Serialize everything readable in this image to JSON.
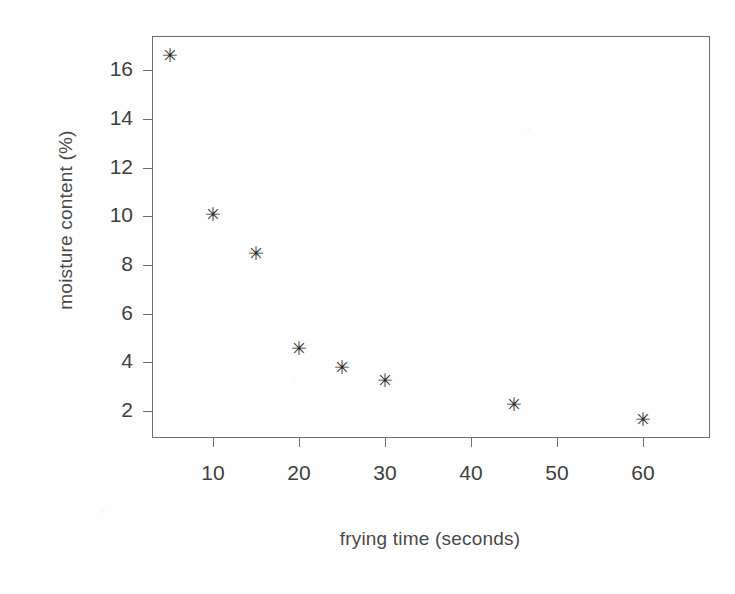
{
  "chart_data": {
    "type": "scatter",
    "title": "",
    "xlabel": "frying time (seconds)",
    "ylabel": "moisture content (%)",
    "x": [
      5,
      10,
      15,
      20,
      25,
      30,
      45,
      60
    ],
    "values": [
      16.6,
      10.1,
      8.5,
      4.6,
      3.8,
      3.3,
      2.3,
      1.7
    ],
    "series": [
      {
        "name": "moisture content",
        "points": [
          {
            "x": 5,
            "y": 16.6
          },
          {
            "x": 10,
            "y": 10.1
          },
          {
            "x": 15,
            "y": 8.5
          },
          {
            "x": 20,
            "y": 4.6
          },
          {
            "x": 25,
            "y": 3.8
          },
          {
            "x": 30,
            "y": 3.3
          },
          {
            "x": 45,
            "y": 2.3
          },
          {
            "x": 60,
            "y": 1.7
          }
        ]
      }
    ],
    "xlim": [
      2.9,
      67.8
    ],
    "ylim": [
      0.9,
      17.4
    ],
    "xticks": [
      10,
      20,
      30,
      40,
      50,
      60
    ],
    "yticks": [
      2,
      4,
      6,
      8,
      10,
      12,
      14,
      16
    ],
    "xticklabels": [
      "10",
      "20",
      "30",
      "40",
      "50",
      "60"
    ],
    "yticklabels": [
      "2",
      "4",
      "6",
      "8",
      "10",
      "12",
      "14",
      "16"
    ],
    "marker": "star-marker",
    "marker_glyph": "✳",
    "marker_color": "#2f2f2f",
    "grid": false,
    "legend": false,
    "legend_position": "none",
    "frame_color": "#6e6e6e",
    "background_color": "#fefefe"
  }
}
